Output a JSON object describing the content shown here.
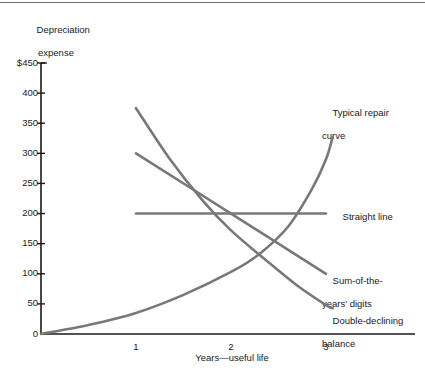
{
  "figure": {
    "y_axis_title_line1": "Depreciation",
    "y_axis_title_line2": "expense",
    "x_axis_title": "Years—useful life"
  },
  "chart_data": {
    "type": "line",
    "title": "",
    "xlabel": "Years—useful life",
    "ylabel": "Depreciation expense",
    "xlim": [
      0,
      3.45
    ],
    "ylim": [
      0,
      450
    ],
    "grid": false,
    "legend_position": "right-inline-labels",
    "x_ticks": [
      "1",
      "2",
      "3"
    ],
    "x_tick_values": [
      1,
      2,
      3
    ],
    "y_ticks": [
      "0",
      "50",
      "100",
      "150",
      "200",
      "250",
      "300",
      "350",
      "400",
      "$450"
    ],
    "y_tick_values": [
      0,
      50,
      100,
      150,
      200,
      250,
      300,
      350,
      400,
      450
    ],
    "line_color": "#787878",
    "axis_color": "#1a1a1a",
    "series": [
      {
        "name": "Typical repair curve",
        "label_line1": "Typical repair",
        "label_line2": "curve",
        "points": [
          {
            "x": 0.0,
            "y": 0
          },
          {
            "x": 0.5,
            "y": 15
          },
          {
            "x": 1.0,
            "y": 35
          },
          {
            "x": 1.5,
            "y": 65
          },
          {
            "x": 2.0,
            "y": 103
          },
          {
            "x": 2.3,
            "y": 133
          },
          {
            "x": 2.6,
            "y": 178
          },
          {
            "x": 2.85,
            "y": 240
          },
          {
            "x": 3.0,
            "y": 290
          },
          {
            "x": 3.07,
            "y": 327
          }
        ]
      },
      {
        "name": "Straight line",
        "label_line1": "Straight line",
        "label_line2": "",
        "points": [
          {
            "x": 1.0,
            "y": 200
          },
          {
            "x": 3.0,
            "y": 200
          }
        ]
      },
      {
        "name": "Sum-of-the-years' digits",
        "label_line1": "Sum-of-the-",
        "label_line2": "years' digits",
        "points": [
          {
            "x": 1.0,
            "y": 300
          },
          {
            "x": 2.0,
            "y": 200
          },
          {
            "x": 3.0,
            "y": 100
          }
        ]
      },
      {
        "name": "Double-declining balance",
        "label_line1": "Double-declining",
        "label_line2": "balance",
        "points": [
          {
            "x": 1.0,
            "y": 375
          },
          {
            "x": 1.35,
            "y": 292
          },
          {
            "x": 1.7,
            "y": 222
          },
          {
            "x": 2.0,
            "y": 172
          },
          {
            "x": 2.35,
            "y": 125
          },
          {
            "x": 2.7,
            "y": 80
          },
          {
            "x": 3.0,
            "y": 48
          },
          {
            "x": 3.07,
            "y": 43
          }
        ]
      }
    ]
  }
}
